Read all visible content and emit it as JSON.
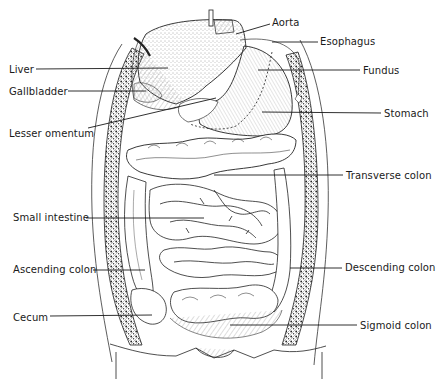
{
  "diagram": {
    "labels": [
      {
        "id": "aorta",
        "text": "Aorta",
        "x": 272,
        "y": 17,
        "line": [
          270,
          24,
          236,
          34
        ]
      },
      {
        "id": "esophagus",
        "text": "Esophagus",
        "x": 320,
        "y": 36,
        "line": [
          318,
          42,
          272,
          42
        ]
      },
      {
        "id": "fundus",
        "text": "Fundus",
        "x": 363,
        "y": 65,
        "line": [
          360,
          70,
          258,
          70
        ]
      },
      {
        "id": "stomach",
        "text": "Stomach",
        "x": 384,
        "y": 108,
        "line": [
          381,
          113,
          262,
          112
        ]
      },
      {
        "id": "liver",
        "text": "Liver",
        "x": 9,
        "y": 64,
        "line": [
          36,
          69,
          168,
          68
        ]
      },
      {
        "id": "gallbladder",
        "text": "Gallbladder",
        "x": 9,
        "y": 86,
        "line": [
          68,
          91,
          146,
          91
        ]
      },
      {
        "id": "lesser-omentum",
        "text": "Lesser omentum",
        "x": 9,
        "y": 128,
        "line": [
          88,
          128,
          216,
          98
        ]
      },
      {
        "id": "transverse-colon",
        "text": "Transverse colon",
        "x": 346,
        "y": 170,
        "line": [
          343,
          175,
          214,
          175
        ]
      },
      {
        "id": "small-intestine",
        "text": "Small intestine",
        "x": 13,
        "y": 212,
        "line": [
          86,
          218,
          204,
          218
        ]
      },
      {
        "id": "ascending-colon",
        "text": "Ascending colon",
        "x": 13,
        "y": 264,
        "line": [
          93,
          270,
          145,
          270
        ]
      },
      {
        "id": "descending-colon",
        "text": "Descending colon",
        "x": 345,
        "y": 262,
        "line": [
          342,
          268,
          290,
          268
        ]
      },
      {
        "id": "cecum",
        "text": "Cecum",
        "x": 13,
        "y": 312,
        "line": [
          50,
          316,
          152,
          315
        ]
      },
      {
        "id": "sigmoid-colon",
        "text": "Sigmoid colon",
        "x": 360,
        "y": 320,
        "line": [
          357,
          325,
          230,
          325
        ]
      }
    ]
  },
  "colors": {
    "ink": "#1a1a1a",
    "paper": "#ffffff",
    "stipple": "#555555"
  }
}
